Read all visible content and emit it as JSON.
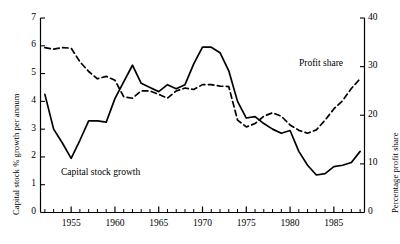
{
  "chart_data": {
    "type": "line",
    "title": "",
    "subtitle": "",
    "xlabel": "",
    "xlim": [
      1951.5,
      1988.5
    ],
    "grid": false,
    "legend_position": "inline-annotations",
    "x_ticks_major": [
      1955,
      1960,
      1965,
      1970,
      1975,
      1980,
      1985
    ],
    "x_tick_labels": [
      "1955",
      "1960",
      "1965",
      "1970",
      "1975",
      "1980",
      "1985"
    ],
    "x_ticks_minor_step": 1,
    "axes": [
      {
        "side": "left",
        "label": "Capital stock % growth per annum",
        "lim": [
          0,
          7
        ],
        "ticks": [
          0,
          1,
          2,
          3,
          4,
          5,
          6,
          7
        ],
        "tick_labels": [
          "0",
          "1",
          "2",
          "3",
          "4",
          "5",
          "6",
          "7"
        ]
      },
      {
        "side": "right",
        "label": "Percentage profit share",
        "lim": [
          0,
          40
        ],
        "ticks": [
          0,
          10,
          20,
          30,
          40
        ],
        "tick_labels": [
          "0",
          "10",
          "20",
          "30",
          "40"
        ]
      }
    ],
    "series": [
      {
        "name": "Capital stock growth",
        "axis": "left",
        "style": "solid",
        "color": "#000000",
        "annotation": "Capital stock growth",
        "x": [
          1952,
          1953,
          1954,
          1955,
          1956,
          1957,
          1958,
          1959,
          1960,
          1961,
          1962,
          1963,
          1964,
          1965,
          1966,
          1967,
          1968,
          1969,
          1970,
          1971,
          1972,
          1973,
          1974,
          1975,
          1976,
          1977,
          1978,
          1979,
          1980,
          1981,
          1982,
          1983,
          1984,
          1985,
          1986,
          1987,
          1988
        ],
        "values": [
          4.25,
          3.0,
          2.5,
          1.95,
          2.6,
          3.3,
          3.3,
          3.25,
          4.1,
          4.7,
          5.3,
          4.65,
          4.5,
          4.35,
          4.6,
          4.45,
          4.6,
          5.35,
          5.95,
          5.95,
          5.75,
          5.1,
          4.0,
          3.4,
          3.45,
          3.2,
          3.0,
          2.85,
          2.95,
          2.2,
          1.7,
          1.35,
          1.4,
          1.65,
          1.7,
          1.8,
          2.2
        ]
      },
      {
        "name": "Profit share",
        "axis": "right",
        "style": "dashed",
        "color": "#000000",
        "annotation": "Profit share",
        "x": [
          1952,
          1953,
          1954,
          1955,
          1956,
          1957,
          1958,
          1959,
          1960,
          1961,
          1962,
          1963,
          1964,
          1965,
          1966,
          1967,
          1968,
          1969,
          1970,
          1971,
          1972,
          1973,
          1974,
          1975,
          1976,
          1977,
          1978,
          1979,
          1980,
          1981,
          1982,
          1983,
          1984,
          1985,
          1986,
          1987,
          1988
        ],
        "values": [
          33.9,
          33.6,
          33.9,
          33.8,
          31.0,
          29.0,
          27.5,
          28.0,
          27.2,
          23.8,
          23.5,
          25.0,
          25.0,
          24.3,
          23.5,
          25.0,
          25.6,
          25.3,
          26.3,
          26.3,
          26.0,
          25.9,
          19.0,
          17.6,
          18.3,
          19.8,
          20.5,
          19.8,
          18.0,
          16.9,
          16.3,
          17.0,
          19.0,
          21.3,
          23.0,
          25.5,
          27.5
        ]
      }
    ]
  },
  "annotations": {
    "capital_stock_growth": "Capital stock growth",
    "profit_share": "Profit share"
  }
}
